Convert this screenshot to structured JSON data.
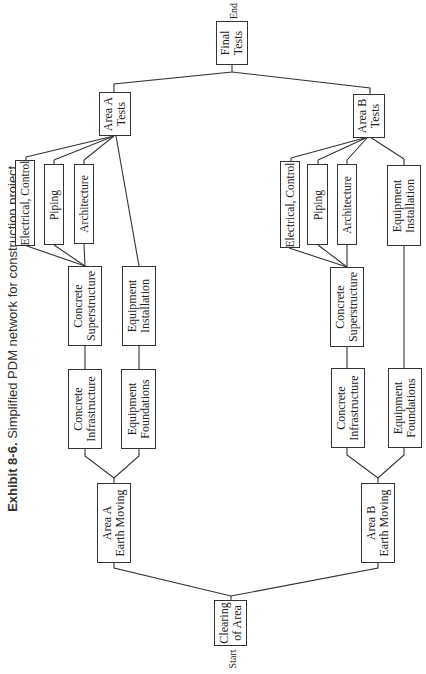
{
  "caption": {
    "exhibit": "Exhibit 8-6.",
    "text": "Simplified PDM network for construction project."
  },
  "markers": {
    "start": "Start",
    "end": "End"
  },
  "nodes": {
    "final_tests": {
      "line1": "Final",
      "line2": "Tests"
    },
    "area_a_tests": {
      "line1": "Area A",
      "line2": "Tests"
    },
    "area_b_tests": {
      "line1": "Area B",
      "line2": "Tests"
    },
    "a_electrical": {
      "line1": "Electrical, Control"
    },
    "a_piping": {
      "line1": "Piping"
    },
    "a_architecture": {
      "line1": "Architecture"
    },
    "a_concrete_super": {
      "line1": "Concrete",
      "line2": "Superstructure"
    },
    "a_equip_install": {
      "line1": "Equipment",
      "line2": "Installation"
    },
    "a_concrete_infra": {
      "line1": "Concrete",
      "line2": "Infrastructure"
    },
    "a_equip_found": {
      "line1": "Equipment",
      "line2": "Foundations"
    },
    "a_earth_moving": {
      "line1": "Area A",
      "line2": "Earth Moving"
    },
    "b_electrical": {
      "line1": "Electrical, Control"
    },
    "b_piping": {
      "line1": "Piping"
    },
    "b_architecture": {
      "line1": "Architecture"
    },
    "b_concrete_super": {
      "line1": "Concrete",
      "line2": "Superstructure"
    },
    "b_equip_install": {
      "line1": "Equipment",
      "line2": "Installation"
    },
    "b_concrete_infra": {
      "line1": "Concrete",
      "line2": "Infrastructure"
    },
    "b_equip_found": {
      "line1": "Equipment",
      "line2": "Foundations"
    },
    "b_earth_moving": {
      "line1": "Area B",
      "line2": "Earth Moving"
    },
    "clearing": {
      "line1": "Clearing",
      "line2": "of Area"
    }
  },
  "colors": {
    "stroke": "#333333",
    "background": "#ffffff"
  }
}
